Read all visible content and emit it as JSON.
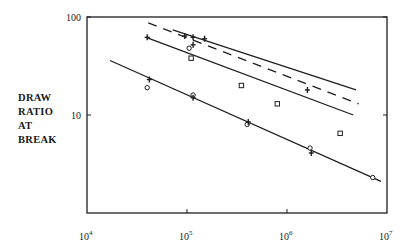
{
  "chart_data": {
    "type": "line",
    "title": "",
    "xlabel": "",
    "ylabel": "DRAW RATIO AT BREAK",
    "xscale": "log",
    "yscale": "log",
    "xlim": [
      10000,
      10000000
    ],
    "ylim": [
      1,
      100
    ],
    "x_ticks": [
      {
        "base": "10",
        "exp": "4",
        "value": 10000
      },
      {
        "base": "10",
        "exp": "5",
        "value": 100000
      },
      {
        "base": "10",
        "exp": "6",
        "value": 1000000
      },
      {
        "base": "10",
        "exp": "7",
        "value": 10000000
      }
    ],
    "y_ticks": [
      {
        "label": "100",
        "value": 100
      },
      {
        "label": "10",
        "value": 10
      }
    ],
    "grid": false,
    "legend": null,
    "series": [
      {
        "name": "upper solid line",
        "style": "solid",
        "line": [
          [
            72000,
            74
          ],
          [
            4900000,
            18
          ]
        ],
        "markers": [
          {
            "symbol": "+",
            "x": 95000,
            "y": 64
          },
          {
            "symbol": "+",
            "x": 115000,
            "y": 62
          },
          {
            "symbol": "+",
            "x": 150000,
            "y": 60
          },
          {
            "symbol": "+",
            "x": 1600000,
            "y": 18
          }
        ]
      },
      {
        "name": "dashed line",
        "style": "dashed",
        "line": [
          [
            41000,
            87
          ],
          [
            5200000,
            13
          ]
        ],
        "markers": []
      },
      {
        "name": "middle solid line",
        "style": "solid",
        "line": [
          [
            39000,
            62
          ],
          [
            4600000,
            10
          ]
        ],
        "markers": [
          {
            "symbol": "+",
            "x": 40000,
            "y": 62
          },
          {
            "symbol": "o",
            "x": 105000,
            "y": 48
          },
          {
            "symbol": "+",
            "x": 115000,
            "y": 52
          },
          {
            "symbol": "square",
            "x": 110000,
            "y": 38
          },
          {
            "symbol": "square",
            "x": 350000,
            "y": 20
          },
          {
            "symbol": "square",
            "x": 800000,
            "y": 13
          },
          {
            "symbol": "square",
            "x": 3400000,
            "y": 6.5
          }
        ]
      },
      {
        "name": "lower solid line",
        "style": "solid",
        "line": [
          [
            17000,
            36
          ],
          [
            8700000,
            2.1
          ]
        ],
        "markers": [
          {
            "symbol": "o",
            "x": 40000,
            "y": 19
          },
          {
            "symbol": "+",
            "x": 42000,
            "y": 23
          },
          {
            "symbol": "o",
            "x": 115000,
            "y": 16
          },
          {
            "symbol": "+",
            "x": 115000,
            "y": 15
          },
          {
            "symbol": "o",
            "x": 400000,
            "y": 8
          },
          {
            "symbol": "+",
            "x": 410000,
            "y": 8.5
          },
          {
            "symbol": "o",
            "x": 1700000,
            "y": 4.6
          },
          {
            "symbol": "+",
            "x": 1750000,
            "y": 4.1
          },
          {
            "symbol": "o",
            "x": 7200000,
            "y": 2.3
          }
        ]
      }
    ]
  },
  "axes": {
    "ylabel_lines": [
      "DRAW",
      "RATIO",
      "AT",
      "BREAK"
    ]
  }
}
